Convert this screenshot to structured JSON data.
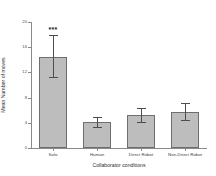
{
  "chart_data": {
    "type": "bar",
    "title": "",
    "xlabel": "Collaborator conditions",
    "ylabel": "Mean Number of moves",
    "categories": [
      "Solo",
      "Human",
      "Direct Robot",
      "Non-Direct Robot"
    ],
    "values": [
      14.5,
      4.1,
      5.2,
      5.7
    ],
    "errors_upper": [
      3.5,
      0.9,
      1.2,
      1.4
    ],
    "errors_lower": [
      3.2,
      0.8,
      1.1,
      1.3
    ],
    "ylim": [
      0,
      20
    ],
    "yticks": [
      0,
      4,
      8,
      12,
      16,
      20
    ],
    "ytick_labels": [
      "0",
      "4",
      "8",
      "12",
      "16",
      "20"
    ],
    "grid": false,
    "legend": "none",
    "annotations": [
      {
        "category": "Solo",
        "text": "***"
      }
    ],
    "bar_color": "#bdbdbd",
    "bar_edge_color": "#6e6e6e",
    "error_color": "#4d4d4d",
    "axis_color": "#8a8a8a"
  }
}
